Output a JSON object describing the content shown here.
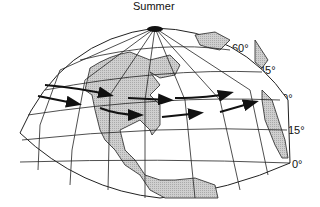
{
  "map": {
    "title": "Summer",
    "latitude_labels": [
      {
        "label": "60°",
        "x": 232,
        "y": 42
      },
      {
        "label": "45°",
        "x": 259,
        "y": 64
      },
      {
        "label": "30°",
        "x": 276,
        "y": 92
      },
      {
        "label": "15°",
        "x": 288,
        "y": 124
      },
      {
        "label": "0°",
        "x": 292,
        "y": 158
      }
    ],
    "colors": {
      "land": "#c8c8c8",
      "lines": "#222222",
      "arrows": "#111111"
    },
    "feature": "Jet stream paths over North America"
  }
}
